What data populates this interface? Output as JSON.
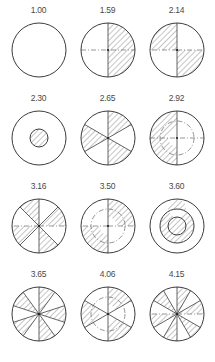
{
  "figure": {
    "type": "geometric-diagram-grid",
    "columns": 3,
    "rows": 4,
    "background_color": "#ffffff",
    "outline_color": "#3c3c3c",
    "hatch_color": "#6f6f6f",
    "label_color": "#4a4a4a"
  },
  "chart_data": {
    "type": "table",
    "title": "",
    "xlabel": "",
    "ylabel": "",
    "categories": [
      "1.00",
      "1.59",
      "2.14",
      "2.30",
      "2.65",
      "2.92",
      "3.16",
      "3.50",
      "3.60",
      "3.65",
      "4.06",
      "4.15"
    ],
    "values": [
      1.0,
      1.59,
      2.14,
      2.3,
      2.65,
      2.92,
      3.16,
      3.5,
      3.6,
      3.65,
      4.06,
      4.15
    ]
  },
  "cells": [
    {
      "id": "cell-1",
      "label": "1.00",
      "shape": "plain-circle",
      "sectors": 0,
      "hatched_sectors": [],
      "inner_circle": false,
      "inner_hatched": false
    },
    {
      "id": "cell-2",
      "label": "1.59",
      "shape": "half-circle",
      "sectors": 2,
      "hatched_sectors": [
        0
      ],
      "inner_circle": false,
      "inner_hatched": false
    },
    {
      "id": "cell-3",
      "label": "2.14",
      "shape": "quadrants",
      "sectors": 4,
      "hatched_sectors": [
        1,
        3
      ],
      "inner_circle": false,
      "inner_hatched": false
    },
    {
      "id": "cell-4",
      "label": "2.30",
      "shape": "concentric-small-core",
      "sectors": 0,
      "hatched_sectors": [],
      "inner_circle": true,
      "inner_hatched": true
    },
    {
      "id": "cell-5",
      "label": "2.65",
      "shape": "six-sectors",
      "sectors": 6,
      "hatched_sectors": [
        0,
        2,
        4
      ],
      "inner_circle": false,
      "inner_hatched": false
    },
    {
      "id": "cell-6",
      "label": "2.92",
      "shape": "annulus-half",
      "sectors": 2,
      "hatched_sectors": [
        1
      ],
      "inner_circle": true,
      "inner_hatched": false
    },
    {
      "id": "cell-7",
      "label": "3.16",
      "shape": "eight-sectors",
      "sectors": 8,
      "hatched_sectors": [
        1,
        3,
        5,
        7
      ],
      "inner_circle": false,
      "inner_hatched": false
    },
    {
      "id": "cell-8",
      "label": "3.50",
      "shape": "annulus-quadrants",
      "sectors": 4,
      "hatched_sectors": [
        0,
        2
      ],
      "inner_circle": true,
      "inner_hatched": false
    },
    {
      "id": "cell-9",
      "label": "3.60",
      "shape": "annulus-ring",
      "sectors": 0,
      "hatched_sectors": [],
      "inner_circle": true,
      "inner_hatched": false
    },
    {
      "id": "cell-10",
      "label": "3.65",
      "shape": "pinwheel-ten",
      "sectors": 10,
      "hatched_sectors": [
        0,
        2,
        4,
        6,
        8
      ],
      "inner_circle": false,
      "inner_hatched": false
    },
    {
      "id": "cell-11",
      "label": "4.06",
      "shape": "annulus-six-sectors",
      "sectors": 6,
      "hatched_sectors": [
        0,
        2,
        4
      ],
      "inner_circle": true,
      "inner_hatched": false
    },
    {
      "id": "cell-12",
      "label": "4.15",
      "shape": "twelve-sectors",
      "sectors": 12,
      "hatched_sectors": [
        0,
        2,
        4,
        6,
        8,
        10
      ],
      "inner_circle": false,
      "inner_hatched": false
    }
  ]
}
